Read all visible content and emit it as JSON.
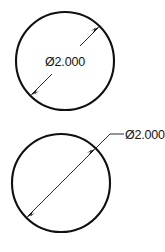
{
  "drawing": {
    "background_color": "#ffffff",
    "line_color": "#101010",
    "dimension_color": "#2b2b2b",
    "text_color": "#141414",
    "views": [
      {
        "id": "top-view",
        "shape": "circle",
        "center_x": 65,
        "center_y": 61,
        "radius": 49,
        "dimension": {
          "type": "diameter",
          "style": "inline-broken-dimension-line",
          "label": "Ø2.000",
          "symbol": "Ø",
          "value": "2.000",
          "arrow_start": {
            "x": 30,
            "y": 96
          },
          "arrow_end": {
            "x": 100,
            "y": 26
          },
          "text_x": 65,
          "text_y": 66
        }
      },
      {
        "id": "bottom-view",
        "shape": "circle",
        "center_x": 61,
        "center_y": 183,
        "radius": 49,
        "dimension": {
          "type": "diameter",
          "style": "leader-outside",
          "label": "Ø2.000",
          "symbol": "Ø",
          "value": "2.000",
          "arrow_start": {
            "x": 26,
            "y": 218
          },
          "arrow_end": {
            "x": 96,
            "y": 148
          },
          "leader_elbow": {
            "x": 110,
            "y": 134
          },
          "leader_shoulder_end": {
            "x": 124,
            "y": 134
          },
          "text_x": 125,
          "text_y": 139
        }
      }
    ]
  }
}
